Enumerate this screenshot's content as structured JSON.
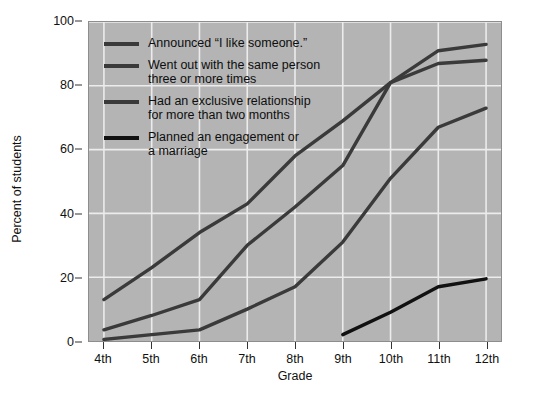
{
  "chart_data": {
    "type": "line",
    "title": "",
    "xlabel": "Grade",
    "ylabel": "Percent of students",
    "categories": [
      "4th",
      "5th",
      "6th",
      "7th",
      "8th",
      "9th",
      "10th",
      "11th",
      "12th"
    ],
    "ylim": [
      0,
      100
    ],
    "yticks": [
      0,
      20,
      40,
      60,
      80,
      100
    ],
    "grid": true,
    "legend_position": "upper-left-inside",
    "series": [
      {
        "name": "Announced “I like someone.”",
        "color": "#3a3a3a",
        "values": [
          13,
          23,
          34,
          43,
          58,
          69,
          81,
          91,
          93
        ]
      },
      {
        "name": "Went out with the same person\nthree or more times",
        "color": "#3a3a3a",
        "values": [
          3.5,
          8,
          13,
          30,
          42,
          55,
          81,
          87,
          88
        ]
      },
      {
        "name": "Had an exclusive relationship\nfor more than two months",
        "color": "#3a3a3a",
        "values": [
          0.5,
          2,
          3.5,
          10,
          17,
          31,
          51,
          67,
          73
        ]
      },
      {
        "name": "Planned an engagement or\na marriage",
        "color": "#111111",
        "values": [
          null,
          null,
          null,
          null,
          null,
          2,
          9,
          17,
          19.5
        ]
      }
    ]
  },
  "axes": {
    "y_title": "Percent of students",
    "x_title": "Grade",
    "y_tick_labels": [
      "0",
      "20",
      "40",
      "60",
      "80",
      "100"
    ],
    "x_tick_labels": [
      "4th",
      "5th",
      "6th",
      "7th",
      "8th",
      "9th",
      "10th",
      "11th",
      "12th"
    ]
  },
  "legend": {
    "entries": [
      {
        "label": "Announced “I like someone.”",
        "color": "#3a3a3a"
      },
      {
        "label": "Went out with the same person\nthree or more times",
        "color": "#3a3a3a"
      },
      {
        "label": "Had an exclusive relationship\nfor more than two months",
        "color": "#3a3a3a"
      },
      {
        "label": "Planned an engagement or\na marriage",
        "color": "#111111"
      }
    ]
  },
  "style": {
    "plot_background": "#b4b4b4",
    "grid_color": "#ececec",
    "page_background": "#ffffff",
    "text_color": "#111111"
  }
}
